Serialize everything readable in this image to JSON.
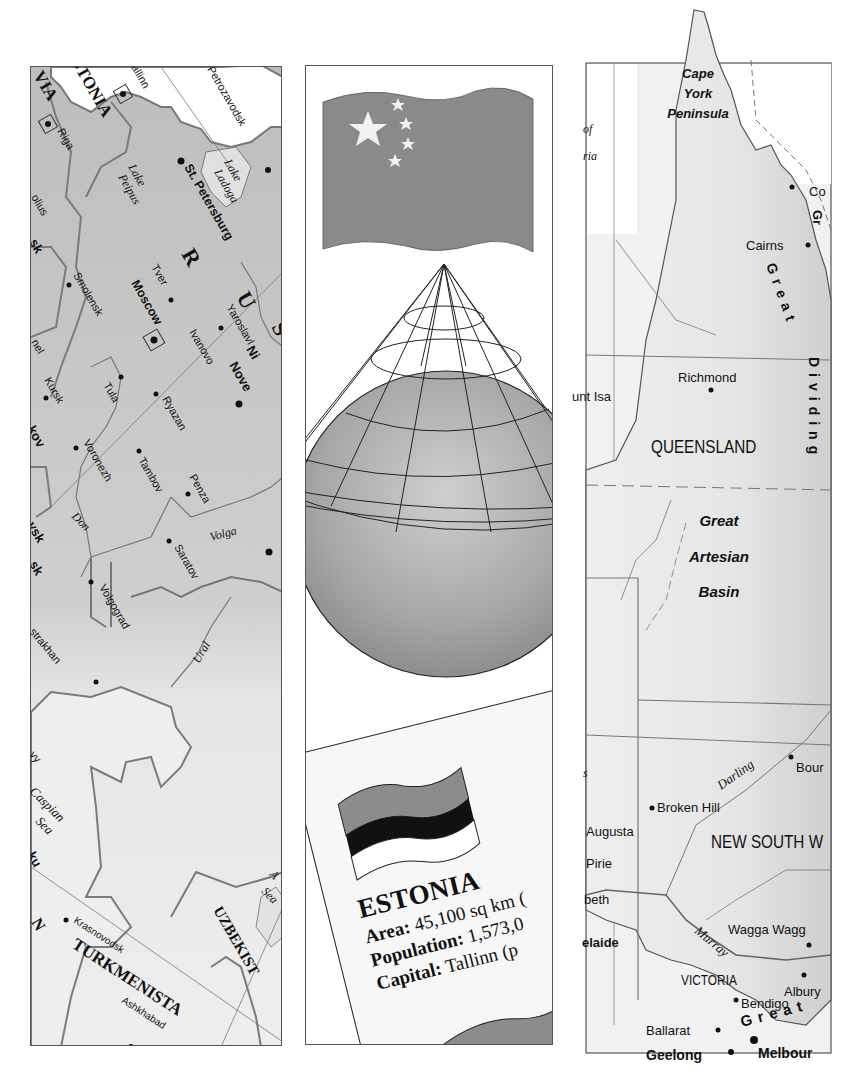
{
  "panels": {
    "russia_map": {
      "title": "Western Russia map excerpt",
      "countries": [
        "ESTONIA",
        "LATVIA",
        "RUSSIA",
        "TURKMENISTAN",
        "UZBEKISTAN"
      ],
      "country_labels": {
        "latvia_partial": "VIA",
        "estonia_partial": "STONIA",
        "russia_letters": [
          "R",
          "U",
          "S"
        ],
        "turkmenistan_partial": "TURKMENISTA",
        "uzbekistan_partial": "UZBEKIST",
        "kazakhstan_partial": "N"
      },
      "cities": [
        {
          "name": "allinn",
          "note": "Tallinn (cropped)"
        },
        {
          "name": "Riga"
        },
        {
          "name": "Petrozavodsk"
        },
        {
          "name": "St. Petersburg"
        },
        {
          "name": "Tver"
        },
        {
          "name": "Moscow"
        },
        {
          "name": "Yaroslavl"
        },
        {
          "name": "Ivanovo"
        },
        {
          "name": "Smolensk"
        },
        {
          "name": "Tula"
        },
        {
          "name": "Kursk"
        },
        {
          "name": "Ryazan"
        },
        {
          "name": "Voronezh"
        },
        {
          "name": "Tambov"
        },
        {
          "name": "Penza"
        },
        {
          "name": "Saratov"
        },
        {
          "name": "Volgograd"
        },
        {
          "name": "strakhan",
          "note": "Astrakhan (cropped)"
        },
        {
          "name": "Krasnovodsk"
        },
        {
          "name": "Ashkhabad"
        }
      ],
      "partial_labels": [
        "olius",
        "sk",
        "nel",
        "kov",
        "vsk",
        "sk",
        "yy",
        "ku",
        "Ni",
        "Nove"
      ],
      "water_labels": [
        "Lake Peipus",
        "Lake Ladoga",
        "Don",
        "Volga",
        "Ural",
        "Caspian Sea",
        "Aral Sea"
      ]
    },
    "center": {
      "flag_top": {
        "country": "China",
        "color": "#8a8a8a",
        "star_color": "#f2f2f2"
      },
      "diagram": {
        "title": "Conic projection globe",
        "globe_color": "#a8a8a8"
      },
      "fact_card": {
        "country": "ESTONIA",
        "area_label": "Area:",
        "area_value": "45,100 sq km (",
        "population_label": "Population:",
        "population_value": "1,573,0",
        "capital_label": "Capital:",
        "capital_value": "Tallinn (p",
        "flag_stripes": [
          "#8c8c8c",
          "#111111",
          "#ffffff"
        ]
      }
    },
    "australia_map": {
      "region_labels": [
        "Cape York Peninsula",
        "QUEENSLAND",
        "NEW SOUTH W",
        "VICTORIA"
      ],
      "feature_labels": [
        "Great Artesian Basin",
        "Great Dividing",
        "Great",
        "Gulf of Carpentaria (partial)"
      ],
      "partial_labels": {
        "gulf_top": "of",
        "gulf_bottom": "ria",
        "coral": "Co",
        "gt": "Gr",
        "mount_isa": "unt Isa",
        "port_augusta": "Augusta",
        "port_pirie": "Pirie",
        "elizabeth": "beth",
        "adelaide": "elaide",
        "lake": "s",
        "bourke": "Bour",
        "wagga": "Wagga Wagg",
        "melbourne": "Melbour"
      },
      "cities": [
        "Cairns",
        "Richmond",
        "Broken Hill",
        "Albury",
        "Bendigo",
        "Ballarat",
        "Geelong",
        "Melbourne"
      ],
      "rivers": [
        "Darling",
        "Murray"
      ]
    }
  }
}
